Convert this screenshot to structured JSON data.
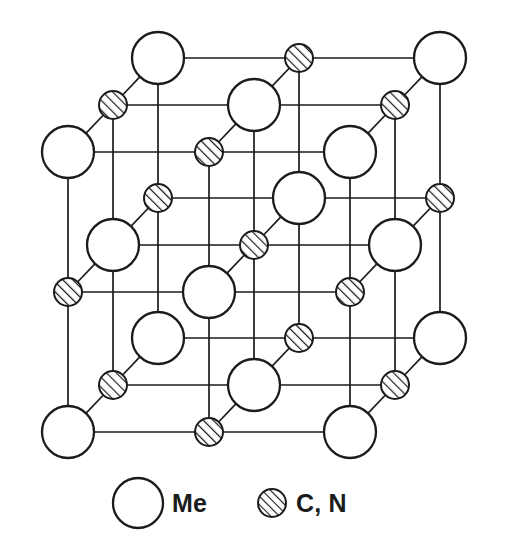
{
  "figure": {
    "background_color": "#ffffff",
    "line_color": "#1b1b1b",
    "line_width": 1.7,
    "atom_outline_color": "#1b1b1b",
    "atom_fill_color": "#ffffff",
    "hatch_color": "#1b1b1b"
  },
  "geometry": {
    "origin_x": 68,
    "origin_y": 432,
    "step_x": 141,
    "step_y": -140,
    "depth_dx": 45,
    "depth_dy": -47,
    "grid_size": 3,
    "metal_radius": 26,
    "interstitial_radius": 14
  },
  "species": {
    "metal": {
      "key": "Me",
      "label": "Me",
      "style": "open-circle",
      "radius": 26
    },
    "interstitial": {
      "key": "CN",
      "label": "C, N",
      "style": "hatched-circle",
      "radius": 14,
      "hatch_angle_deg": 45
    }
  },
  "legend": {
    "items": [
      {
        "marker": "open-circle",
        "label": "Me",
        "cx": 138,
        "cy": 503,
        "r": 25,
        "text_x": 172,
        "text_y": 512
      },
      {
        "marker": "hatched-circle",
        "label": "C, N",
        "cx": 272,
        "cy": 503,
        "r": 14,
        "text_x": 296,
        "text_y": 512
      }
    ]
  },
  "chart_data": {
    "type": "diagram",
    "subtype": "crystal-lattice-3d",
    "lattice_type": "B1 (NaCl-type) face-centred cubic",
    "cell_repeats": [
      2,
      2,
      2
    ],
    "node_counts": {
      "Me": 14,
      "C_N": 13,
      "total_drawn": 27
    },
    "legend_entries": [
      "Me",
      "C, N"
    ],
    "sites": [
      {
        "i": 0,
        "j": 0,
        "k": 0,
        "species": "Me"
      },
      {
        "i": 1,
        "j": 0,
        "k": 0,
        "species": "CN"
      },
      {
        "i": 2,
        "j": 0,
        "k": 0,
        "species": "Me"
      },
      {
        "i": 0,
        "j": 1,
        "k": 0,
        "species": "CN"
      },
      {
        "i": 1,
        "j": 1,
        "k": 0,
        "species": "Me"
      },
      {
        "i": 2,
        "j": 1,
        "k": 0,
        "species": "CN"
      },
      {
        "i": 0,
        "j": 2,
        "k": 0,
        "species": "Me"
      },
      {
        "i": 1,
        "j": 2,
        "k": 0,
        "species": "CN"
      },
      {
        "i": 2,
        "j": 2,
        "k": 0,
        "species": "Me"
      },
      {
        "i": 0,
        "j": 0,
        "k": 1,
        "species": "CN"
      },
      {
        "i": 1,
        "j": 0,
        "k": 1,
        "species": "Me"
      },
      {
        "i": 2,
        "j": 0,
        "k": 1,
        "species": "CN"
      },
      {
        "i": 0,
        "j": 1,
        "k": 1,
        "species": "Me"
      },
      {
        "i": 1,
        "j": 1,
        "k": 1,
        "species": "CN"
      },
      {
        "i": 2,
        "j": 1,
        "k": 1,
        "species": "Me"
      },
      {
        "i": 0,
        "j": 2,
        "k": 1,
        "species": "CN"
      },
      {
        "i": 1,
        "j": 2,
        "k": 1,
        "species": "Me"
      },
      {
        "i": 2,
        "j": 2,
        "k": 1,
        "species": "CN"
      },
      {
        "i": 0,
        "j": 0,
        "k": 2,
        "species": "Me"
      },
      {
        "i": 1,
        "j": 0,
        "k": 2,
        "species": "CN"
      },
      {
        "i": 2,
        "j": 0,
        "k": 2,
        "species": "Me"
      },
      {
        "i": 0,
        "j": 1,
        "k": 2,
        "species": "CN"
      },
      {
        "i": 1,
        "j": 1,
        "k": 2,
        "species": "Me"
      },
      {
        "i": 2,
        "j": 1,
        "k": 2,
        "species": "CN"
      },
      {
        "i": 0,
        "j": 2,
        "k": 2,
        "species": "Me"
      },
      {
        "i": 1,
        "j": 2,
        "k": 2,
        "species": "CN"
      },
      {
        "i": 2,
        "j": 2,
        "k": 2,
        "species": "Me"
      }
    ]
  }
}
